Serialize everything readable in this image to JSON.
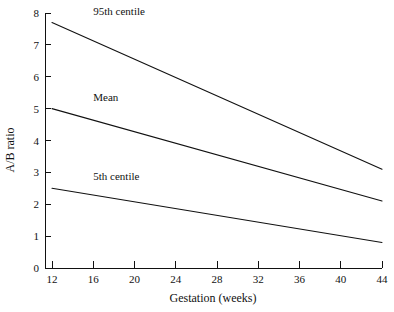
{
  "chart_data": {
    "type": "line",
    "title": "",
    "xlabel": "Gestation (weeks)",
    "ylabel": "A/B ratio",
    "xlim": [
      12,
      44
    ],
    "ylim": [
      0,
      8
    ],
    "xticks": [
      12,
      16,
      20,
      24,
      28,
      32,
      36,
      40,
      44
    ],
    "xtick_labels": [
      "12",
      "16",
      "20",
      "24",
      "28",
      "32",
      "36",
      "40",
      "44"
    ],
    "yticks": [
      0,
      1,
      2,
      3,
      4,
      5,
      6,
      7,
      8
    ],
    "ytick_labels": [
      "0",
      "1",
      "2",
      "3",
      "4",
      "5",
      "6",
      "7",
      "8"
    ],
    "grid": false,
    "legend_position": "inline-annotations",
    "line_color": "#111111",
    "series": [
      {
        "name": "95th centile",
        "label": "95th centile",
        "label_x": 16.0,
        "label_y": 7.95,
        "x": [
          12,
          44
        ],
        "values": [
          7.7,
          3.1
        ]
      },
      {
        "name": "Mean",
        "label": "Mean",
        "label_x": 16.0,
        "label_y": 5.25,
        "x": [
          12,
          44
        ],
        "values": [
          5.0,
          2.1
        ]
      },
      {
        "name": "5th centile",
        "label": "5th centile",
        "label_x": 16.0,
        "label_y": 2.75,
        "x": [
          12,
          44
        ],
        "values": [
          2.5,
          0.8
        ]
      }
    ]
  }
}
